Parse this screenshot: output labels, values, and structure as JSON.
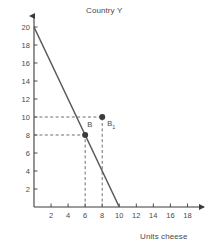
{
  "chart_data": {
    "type": "line",
    "title": "Country Y",
    "xlabel": "Units cheese",
    "ylabel": "Units wine",
    "xlim": [
      0,
      19
    ],
    "ylim": [
      0,
      21
    ],
    "xticks": [
      2,
      4,
      6,
      8,
      10,
      12,
      14,
      16,
      18
    ],
    "yticks": [
      2,
      4,
      6,
      8,
      10,
      12,
      14,
      16,
      18,
      20
    ],
    "grid": false,
    "legend": null,
    "series": [
      {
        "name": "production possibility frontier",
        "type": "line",
        "x": [
          0,
          10
        ],
        "y": [
          20,
          0
        ],
        "color": "#58585a"
      },
      {
        "name": "points",
        "type": "scatter",
        "color": "#3b3b3b",
        "points": [
          {
            "label": "B",
            "x": 6,
            "y": 8
          },
          {
            "label": "B₁",
            "x": 8,
            "y": 10
          }
        ]
      }
    ],
    "guide_lines": [
      {
        "orientation": "horizontal",
        "value": 8,
        "from": 0,
        "to": 6
      },
      {
        "orientation": "horizontal",
        "value": 10,
        "from": 0,
        "to": 8
      },
      {
        "orientation": "vertical",
        "value": 6,
        "from": 0,
        "to": 8
      },
      {
        "orientation": "vertical",
        "value": 8,
        "from": 0,
        "to": 10
      }
    ],
    "annotations": [
      {
        "text": "B",
        "x": 6,
        "y": 8,
        "dx": 2,
        "dy": -9
      },
      {
        "text": "B₁",
        "x": 8,
        "y": 10,
        "dx": 5,
        "dy": 8
      }
    ]
  },
  "axis_labels": {
    "x_ticks": [
      "2",
      "4",
      "6",
      "8",
      "10",
      "12",
      "14",
      "16",
      "18"
    ],
    "y_ticks": [
      "2",
      "4",
      "6",
      "8",
      "10",
      "12",
      "14",
      "16",
      "18",
      "20"
    ]
  },
  "point_labels": {
    "b": "B",
    "b1_base": "B",
    "b1_sub": "1"
  },
  "colors": {
    "line": "#58585a",
    "axis": "#3b3b3b",
    "dash": "#6f6f6f",
    "text": "#4a4a4a",
    "point": "#333333",
    "background": "#ffffff"
  }
}
